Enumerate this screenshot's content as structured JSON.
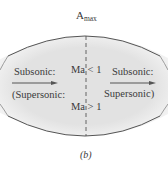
{
  "figure": {
    "top_label_base": "A",
    "top_label_sub": "max",
    "caption": "(b)",
    "center_top_label": "Ma < 1",
    "center_bottom_label": "Ma > 1",
    "left": {
      "top_label": "Subsonic:",
      "bottom_label": "(Supersonic:"
    },
    "right": {
      "top_label": "Subsonic:",
      "bottom_label": "Supersonic)"
    },
    "colors": {
      "fill": "#e3e3e3",
      "outline": "#555555",
      "text": "#3a3a3a",
      "arrow": "#555555"
    }
  }
}
